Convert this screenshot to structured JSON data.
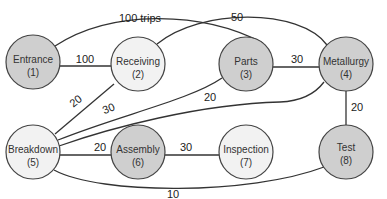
{
  "diagram": {
    "colors": {
      "shaded": "#cfcfcf",
      "unshaded": "#f2f2f2",
      "stroke": "#444444"
    },
    "nodes": [
      {
        "id": 1,
        "name": "Entrance",
        "label": "(1)",
        "x": 33,
        "y": 62,
        "shaded": true
      },
      {
        "id": 2,
        "name": "Receiving",
        "label": "(2)",
        "x": 138,
        "y": 64,
        "shaded": false
      },
      {
        "id": 3,
        "name": "Parts",
        "label": "(3)",
        "x": 246,
        "y": 64,
        "shaded": true
      },
      {
        "id": 4,
        "name": "Metallurgy",
        "label": "(4)",
        "x": 346,
        "y": 64,
        "shaded": true
      },
      {
        "id": 5,
        "name": "Breakdown",
        "label": "(5)",
        "x": 33,
        "y": 152,
        "shaded": false
      },
      {
        "id": 6,
        "name": "Assembly",
        "label": "(6)",
        "x": 138,
        "y": 152,
        "shaded": true
      },
      {
        "id": 7,
        "name": "Inspection",
        "label": "(7)",
        "x": 246,
        "y": 152,
        "shaded": false
      },
      {
        "id": 8,
        "name": "Test",
        "label": "(8)",
        "x": 346,
        "y": 152,
        "shaded": true
      }
    ],
    "edges": [
      {
        "from": 1,
        "to": 3,
        "label": "100 trips"
      },
      {
        "from": 1,
        "to": 2,
        "label": "100"
      },
      {
        "from": 2,
        "to": 4,
        "label": "50"
      },
      {
        "from": 3,
        "to": 4,
        "label": "30"
      },
      {
        "from": 5,
        "to": 2,
        "label": "20"
      },
      {
        "from": 5,
        "to": 3,
        "label": "30"
      },
      {
        "from": 5,
        "to": 4,
        "label": "20"
      },
      {
        "from": 5,
        "to": 6,
        "label": "20"
      },
      {
        "from": 6,
        "to": 7,
        "label": "30"
      },
      {
        "from": 4,
        "to": 8,
        "label": "20"
      },
      {
        "from": 5,
        "to": 8,
        "label": "10"
      }
    ]
  }
}
